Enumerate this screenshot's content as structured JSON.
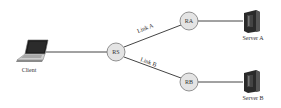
{
  "diagram": {
    "nodes": {
      "client": {
        "label": "Client",
        "type": "laptop"
      },
      "rs": {
        "label": "RS",
        "type": "router"
      },
      "ra": {
        "label": "RA",
        "type": "router"
      },
      "rb": {
        "label": "RB",
        "type": "router"
      },
      "server_a": {
        "label": "Server A",
        "type": "server"
      },
      "server_b": {
        "label": "Server B",
        "type": "server"
      }
    },
    "links": {
      "link_a": {
        "label": "Link A",
        "from": "RS",
        "to": "RA"
      },
      "link_b": {
        "label": "Link B",
        "from": "RS",
        "to": "RB"
      }
    },
    "edges": [
      {
        "from": "Client",
        "to": "RS"
      },
      {
        "from": "RS",
        "to": "RA"
      },
      {
        "from": "RS",
        "to": "RB"
      },
      {
        "from": "RA",
        "to": "Server A"
      },
      {
        "from": "RB",
        "to": "Server B"
      }
    ]
  }
}
